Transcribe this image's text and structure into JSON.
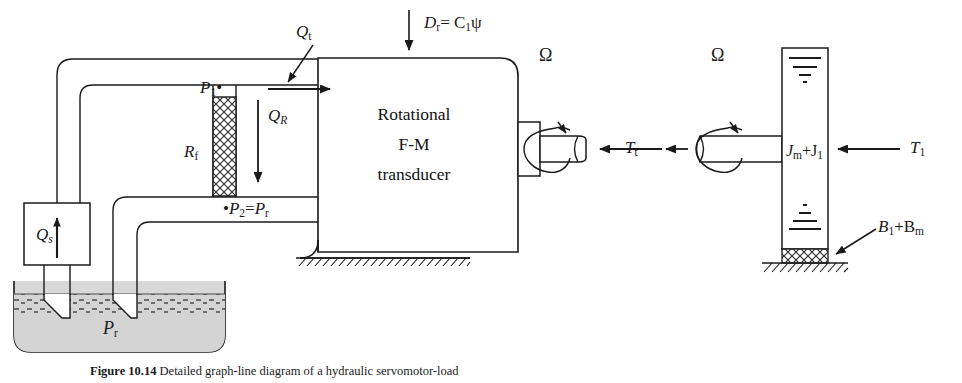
{
  "figure": {
    "number": "Figure 10.14",
    "caption_text": "Detailed graph-line diagram of a hydraulic servomotor-load",
    "caption_full": "Figure 10.14  Detailed graph-line diagram of a hydraulic servomotor-load"
  },
  "colors": {
    "ink": "#1a1a1a",
    "fluid_fill": "#d0d0d0",
    "hatch": "#333333",
    "background": "#ffffff"
  },
  "blocks": {
    "transducer": {
      "line1": "Rotational",
      "line2": "F-M",
      "line3": "transducer"
    }
  },
  "labels": {
    "displacement": {
      "main": "D",
      "sub": "r",
      "eq": "= C",
      "eq_sub": "1",
      "tail": "ψ",
      "full": "Dr = C1ψ"
    },
    "flow_total": {
      "main": "Q",
      "sub": "t",
      "full": "Qt"
    },
    "pressure_1": {
      "main": "P",
      "sub": "1",
      "dot": "•",
      "full": "P1"
    },
    "flow_resistor": {
      "main": "Q",
      "sub": "R",
      "full": "QR"
    },
    "resistance": {
      "main": "R",
      "sub": "f",
      "full": "Rf"
    },
    "pressure_2": {
      "dot": "•",
      "main": "P",
      "sub": "2",
      "eq": "=",
      "main2": "P",
      "sub2": "r",
      "full": "P2 = Pr"
    },
    "flow_supply": {
      "main": "Q",
      "sub": "s",
      "full": "Qs"
    },
    "reservoir_pressure": {
      "main": "P",
      "sub": "r",
      "full": "Pr"
    },
    "omega_left": {
      "main": "Ω",
      "full": "Ω"
    },
    "omega_right": {
      "main": "Ω",
      "full": "Ω"
    },
    "torque_transducer": {
      "main": "T",
      "sub": "t",
      "full": "Tt"
    },
    "torque_load": {
      "main": "T",
      "sub": "1",
      "full": "T1"
    },
    "inertia": {
      "main": "J",
      "sub": "m",
      "plus": "+J",
      "sub2": "1",
      "full": "Jm+J1"
    },
    "damping": {
      "main": "B",
      "sub": "1",
      "plus": "+B",
      "sub2": "m",
      "full": "B1+Bm"
    }
  }
}
